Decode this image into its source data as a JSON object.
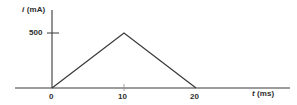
{
  "chart_data": {
    "type": "line",
    "title": "",
    "xlabel": "t (ms)",
    "ylabel": "i (mA)",
    "x": [
      0,
      10,
      20
    ],
    "values": [
      0,
      500,
      0
    ],
    "series": [
      {
        "name": "current waveform",
        "x": [
          0,
          10,
          20
        ],
        "values": [
          0,
          500,
          0
        ]
      }
    ],
    "x_tick_labels": [
      "0",
      "10",
      "20"
    ],
    "y_tick_labels": [
      "500"
    ],
    "x_ticks": [
      0,
      10,
      20
    ],
    "y_ticks": [
      500
    ],
    "xlim": [
      -5,
      30
    ],
    "ylim": [
      0,
      620
    ],
    "grid": false,
    "legend": false,
    "line_color": "#3a3a3a",
    "axis_color": "#3a3a3a",
    "background_color": "#ffffff"
  },
  "axes": {
    "y_label_var": "i",
    "y_label_unit": "(mA)",
    "x_label_var": "t",
    "x_label_unit": "(ms)"
  },
  "ticks": {
    "y_500": "500",
    "x_0": "0",
    "x_10": "10",
    "x_20": "20"
  }
}
